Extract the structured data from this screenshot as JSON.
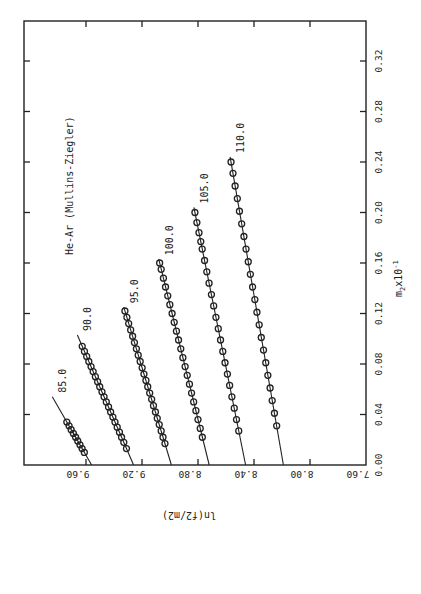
{
  "chart_data": {
    "type": "scatter",
    "title": "He-Ar (Mullins-Ziegler)",
    "orientation": "rotated 90deg: x-axis (m2) runs vertically along right edge; y-axis ln(f2/m2) runs horizontally along bottom, inverted",
    "xlabel": "m2x10^-1",
    "ylabel": "ln(f2/m2)",
    "xlim": [
      0.0,
      0.35
    ],
    "ylim": [
      7.6,
      9.95
    ],
    "x_ticks": [
      "0.00",
      "0.04",
      "0.08",
      "0.12",
      "0.16",
      "0.20",
      "0.24",
      "0.28",
      "0.32"
    ],
    "y_ticks": [
      "9.60",
      "9.20",
      "8.80",
      "8.40",
      "8.00",
      "7.60"
    ],
    "grid": false,
    "legend_position": "annotation near top-left",
    "series": [
      {
        "name": "85.0",
        "fit": {
          "intercept": 9.56,
          "slope": 5.2,
          "x_end": 0.054
        },
        "points": [
          [
            0.01,
            9.612
          ],
          [
            0.013,
            9.628
          ],
          [
            0.016,
            9.643
          ],
          [
            0.019,
            9.659
          ],
          [
            0.022,
            9.674
          ],
          [
            0.025,
            9.69
          ],
          [
            0.028,
            9.706
          ],
          [
            0.031,
            9.721
          ],
          [
            0.034,
            9.737
          ]
        ]
      },
      {
        "name": "90.0",
        "fit": {
          "intercept": 9.26,
          "slope": 3.9,
          "x_end": 0.103
        },
        "points": [
          [
            0.013,
            9.311
          ],
          [
            0.018,
            9.33
          ],
          [
            0.022,
            9.346
          ],
          [
            0.026,
            9.361
          ],
          [
            0.03,
            9.377
          ],
          [
            0.034,
            9.393
          ],
          [
            0.038,
            9.408
          ],
          [
            0.042,
            9.424
          ],
          [
            0.046,
            9.439
          ],
          [
            0.05,
            9.455
          ],
          [
            0.054,
            9.471
          ],
          [
            0.058,
            9.486
          ],
          [
            0.062,
            9.502
          ],
          [
            0.066,
            9.517
          ],
          [
            0.07,
            9.533
          ],
          [
            0.074,
            9.549
          ],
          [
            0.078,
            9.564
          ],
          [
            0.082,
            9.58
          ],
          [
            0.086,
            9.595
          ],
          [
            0.09,
            9.611
          ],
          [
            0.094,
            9.627
          ]
        ]
      },
      {
        "name": "95.0",
        "fit": {
          "intercept": 8.99,
          "slope": 2.72,
          "x_end": 0.125
        },
        "points": [
          [
            0.017,
            9.036
          ],
          [
            0.022,
            9.05
          ],
          [
            0.027,
            9.063
          ],
          [
            0.032,
            9.077
          ],
          [
            0.037,
            9.091
          ],
          [
            0.042,
            9.104
          ],
          [
            0.047,
            9.118
          ],
          [
            0.052,
            9.131
          ],
          [
            0.057,
            9.145
          ],
          [
            0.062,
            9.159
          ],
          [
            0.067,
            9.172
          ],
          [
            0.072,
            9.186
          ],
          [
            0.077,
            9.199
          ],
          [
            0.082,
            9.213
          ],
          [
            0.087,
            9.227
          ],
          [
            0.092,
            9.24
          ],
          [
            0.097,
            9.254
          ],
          [
            0.102,
            9.267
          ],
          [
            0.107,
            9.281
          ],
          [
            0.112,
            9.295
          ],
          [
            0.117,
            9.308
          ],
          [
            0.122,
            9.322
          ]
        ]
      },
      {
        "name": "100.0",
        "fit": {
          "intercept": 8.72,
          "slope": 2.21,
          "x_end": 0.163
        },
        "points": [
          [
            0.022,
            8.769
          ],
          [
            0.029,
            8.784
          ],
          [
            0.036,
            8.8
          ],
          [
            0.043,
            8.815
          ],
          [
            0.05,
            8.831
          ],
          [
            0.057,
            8.846
          ],
          [
            0.064,
            8.861
          ],
          [
            0.071,
            8.877
          ],
          [
            0.078,
            8.892
          ],
          [
            0.085,
            8.908
          ],
          [
            0.092,
            8.923
          ],
          [
            0.099,
            8.939
          ],
          [
            0.106,
            8.954
          ],
          [
            0.113,
            8.97
          ],
          [
            0.12,
            8.985
          ],
          [
            0.127,
            9.001
          ],
          [
            0.134,
            9.016
          ],
          [
            0.141,
            9.032
          ],
          [
            0.148,
            9.047
          ],
          [
            0.155,
            9.063
          ],
          [
            0.16,
            9.074
          ]
        ]
      },
      {
        "name": "105.0",
        "fit": {
          "intercept": 8.46,
          "slope": 1.81,
          "x_end": 0.204
        },
        "points": [
          [
            0.027,
            8.509
          ],
          [
            0.036,
            8.525
          ],
          [
            0.045,
            8.541
          ],
          [
            0.054,
            8.558
          ],
          [
            0.063,
            8.574
          ],
          [
            0.072,
            8.59
          ],
          [
            0.081,
            8.607
          ],
          [
            0.09,
            8.623
          ],
          [
            0.099,
            8.639
          ],
          [
            0.108,
            8.655
          ],
          [
            0.117,
            8.672
          ],
          [
            0.126,
            8.688
          ],
          [
            0.135,
            8.704
          ],
          [
            0.144,
            8.721
          ],
          [
            0.153,
            8.737
          ],
          [
            0.162,
            8.753
          ],
          [
            0.171,
            8.77
          ],
          [
            0.177,
            8.78
          ],
          [
            0.184,
            8.793
          ],
          [
            0.192,
            8.808
          ],
          [
            0.2,
            8.822
          ]
        ]
      },
      {
        "name": "110.0",
        "fit": {
          "intercept": 8.19,
          "slope": 1.56,
          "x_end": 0.244
        },
        "points": [
          [
            0.031,
            8.238
          ],
          [
            0.041,
            8.254
          ],
          [
            0.051,
            8.27
          ],
          [
            0.061,
            8.285
          ],
          [
            0.071,
            8.301
          ],
          [
            0.081,
            8.316
          ],
          [
            0.091,
            8.332
          ],
          [
            0.101,
            8.348
          ],
          [
            0.111,
            8.363
          ],
          [
            0.121,
            8.379
          ],
          [
            0.131,
            8.394
          ],
          [
            0.141,
            8.41
          ],
          [
            0.151,
            8.426
          ],
          [
            0.161,
            8.441
          ],
          [
            0.171,
            8.457
          ],
          [
            0.181,
            8.472
          ],
          [
            0.191,
            8.488
          ],
          [
            0.201,
            8.504
          ],
          [
            0.211,
            8.519
          ],
          [
            0.221,
            8.535
          ],
          [
            0.231,
            8.55
          ],
          [
            0.24,
            8.564
          ]
        ]
      }
    ]
  },
  "annotation": "He-Ar (Mullins-Ziegler)",
  "axes": {
    "x_label_main": "m",
    "x_label_sub": "2",
    "x_label_rest": "x10",
    "x_label_sup": "-1",
    "y_label": "ln(f2/m2)"
  },
  "colors": {
    "ink": "#222222",
    "background": "#ffffff"
  }
}
